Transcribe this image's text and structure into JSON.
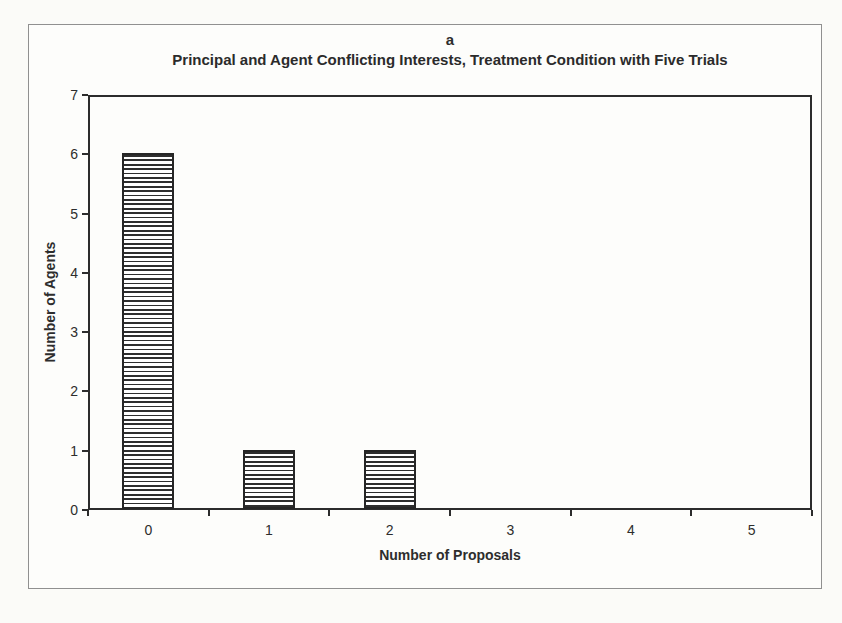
{
  "figure": {
    "panel_label": "a",
    "title": "Principal and Agent Conflicting Interests, Treatment Condition with Five Trials"
  },
  "chart_data": {
    "type": "bar",
    "panel_label": "a",
    "title": "Principal and Agent Conflicting Interests, Treatment Condition with Five Trials",
    "categories": [
      "0",
      "1",
      "2",
      "3",
      "4",
      "5"
    ],
    "values": [
      6,
      1,
      1,
      0,
      0,
      0
    ],
    "xlabel": "Number of Proposals",
    "ylabel": "Number of Agents",
    "ylim": [
      0,
      7
    ],
    "yticks": [
      "0",
      "1",
      "2",
      "3",
      "4",
      "5",
      "6",
      "7"
    ],
    "grid": false,
    "legend": "none",
    "bar_style": {
      "fill": "#ffffff",
      "hatch": "horizontal",
      "hatch_color": "#2e2e2e",
      "border_color": "#262626"
    }
  },
  "colors": {
    "ink": "#2d2d2d",
    "axis": "#2c2c2c",
    "frame_border": "#909090",
    "page_background": "#fbfbf8",
    "plot_background": "#fdfdfb"
  }
}
